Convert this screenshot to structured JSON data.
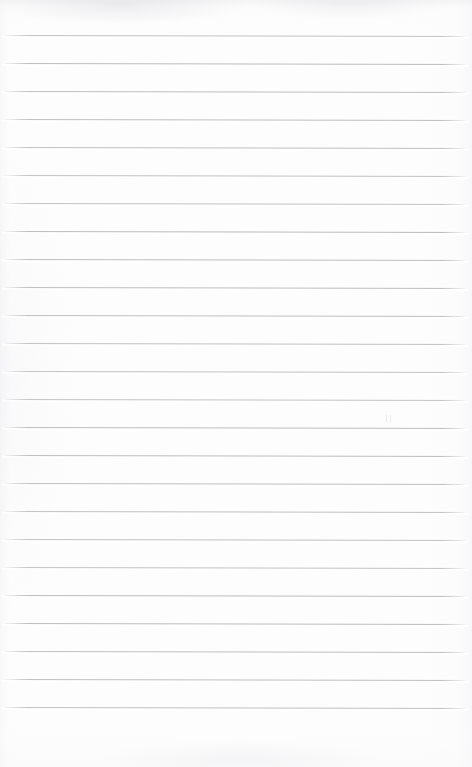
{
  "document": {
    "kind": "scanned-ruled-paper",
    "title": "Blank ruled notebook page",
    "page_width": 472,
    "page_height": 767,
    "text_content": "",
    "handwriting_present": "no",
    "printed_text_present": "no"
  },
  "colors": {
    "paper": "#fdfdfd",
    "rule_line": "#b9b9be",
    "rule_highlight": "#ffffff",
    "edge_shading": "#ececee"
  },
  "ruling": {
    "line_count": 25,
    "first_line_y": 35,
    "line_spacing": 28,
    "line_thickness": 1,
    "left_margin_x": 2,
    "right_end_x": 468,
    "skew_degrees": 0.12,
    "vertical_margin_rule": "none",
    "header_space_top": 35,
    "footer_space_bottom": 40,
    "line_y_positions": [
      35,
      63,
      91,
      119,
      147,
      175,
      203,
      231,
      259,
      287,
      315,
      343,
      371,
      399,
      427,
      455,
      483,
      511,
      539,
      567,
      595,
      623,
      651,
      679,
      707
    ]
  },
  "artifacts": {
    "speck": {
      "x": 387,
      "y": 415,
      "label": "scan-speck"
    }
  }
}
